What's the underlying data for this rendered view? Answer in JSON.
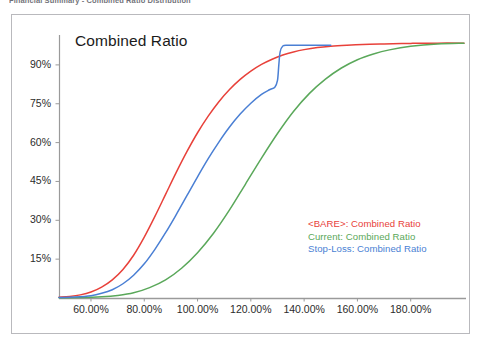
{
  "document": {
    "header_text": "Financial Summary - Combined Ratio Distribution"
  },
  "chart": {
    "title": "Combined Ratio",
    "frame_border_color": "#b9b9bd",
    "axis_color": "#9a9a9a",
    "background": "#ffffff"
  },
  "legend": {
    "position": "inside-right",
    "entries": [
      {
        "label": "<BARE>: Combined Ratio",
        "color": "#e8413a"
      },
      {
        "label": "Current: Combined Ratio",
        "color": "#5aa85a"
      },
      {
        "label": "Stop-Loss: Combined Ratio",
        "color": "#4a7fd4"
      }
    ]
  },
  "chart_data": {
    "type": "line",
    "title": "Combined Ratio",
    "xlabel": "",
    "ylabel": "",
    "grid": false,
    "legend_position": "inside-right",
    "xlim": [
      48,
      200
    ],
    "ylim": [
      0,
      100
    ],
    "xticks": [
      60,
      80,
      100,
      120,
      140,
      160,
      180
    ],
    "xtick_labels": [
      "60.00%",
      "80.00%",
      "100.00%",
      "120.00%",
      "140.00%",
      "160.00%",
      "180.00%"
    ],
    "yticks": [
      15,
      30,
      45,
      60,
      75,
      90
    ],
    "ytick_labels": [
      "15%",
      "30%",
      "45%",
      "60%",
      "75%",
      "90%"
    ],
    "series": [
      {
        "name": "<BARE>: Combined Ratio",
        "color": "#e8413a",
        "width": 1.5,
        "x": [
          48,
          52,
          56,
          60,
          64,
          68,
          72,
          76,
          80,
          84,
          88,
          92,
          96,
          100,
          104,
          108,
          112,
          116,
          120,
          124,
          128,
          132,
          136,
          140,
          145,
          150,
          156,
          162,
          170,
          180,
          190,
          200
        ],
        "y": [
          0.3,
          0.6,
          1.2,
          2.3,
          4.2,
          7.0,
          11.0,
          16.5,
          23.5,
          31.5,
          40.0,
          48.5,
          56.5,
          63.8,
          70.2,
          75.8,
          80.5,
          84.4,
          87.6,
          90.2,
          92.2,
          93.8,
          95.0,
          95.9,
          96.7,
          97.2,
          97.6,
          97.9,
          98.1,
          98.3,
          98.4,
          98.4
        ]
      },
      {
        "name": "Current: Combined Ratio",
        "color": "#5aa85a",
        "width": 1.5,
        "x": [
          48,
          56,
          64,
          70,
          76,
          82,
          88,
          94,
          100,
          106,
          112,
          118,
          124,
          130,
          136,
          142,
          148,
          154,
          160,
          166,
          172,
          180,
          190,
          200
        ],
        "y": [
          0.1,
          0.2,
          0.5,
          1.0,
          2.0,
          4.0,
          7.0,
          11.5,
          17.5,
          25.0,
          34.0,
          44.0,
          54.0,
          63.5,
          72.0,
          79.0,
          84.5,
          88.8,
          92.0,
          94.2,
          95.8,
          97.2,
          98.1,
          98.4
        ]
      },
      {
        "name": "Stop-Loss: Combined Ratio",
        "color": "#4a7fd4",
        "width": 1.5,
        "x": [
          48,
          54,
          60,
          64,
          68,
          72,
          76,
          80,
          84,
          88,
          92,
          96,
          100,
          104,
          108,
          112,
          116,
          120,
          124,
          127,
          129,
          130,
          130.5,
          131,
          132,
          134,
          138,
          142,
          146,
          150
        ],
        "y": [
          0.2,
          0.4,
          0.9,
          1.8,
          3.2,
          5.5,
          8.8,
          13.2,
          18.8,
          25.2,
          32.2,
          39.5,
          46.8,
          53.8,
          60.2,
          66.0,
          71.0,
          75.2,
          78.6,
          80.4,
          81.4,
          84.0,
          90.0,
          95.0,
          97.3,
          97.6,
          97.6,
          97.6,
          97.6,
          97.6
        ]
      }
    ]
  }
}
